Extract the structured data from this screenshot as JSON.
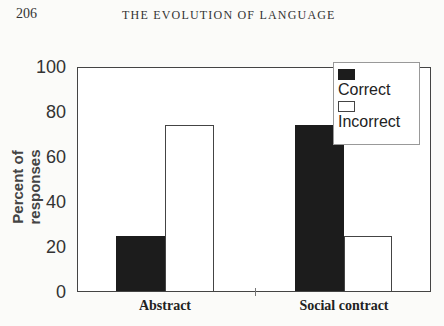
{
  "page": {
    "number": "206",
    "running_head": "THE EVOLUTION OF LANGUAGE"
  },
  "chart": {
    "ylabel": "Percent of responses",
    "yticks": [
      "100",
      "80",
      "60",
      "40",
      "20",
      "0"
    ],
    "categories": [
      "Abstract",
      "Social contract"
    ],
    "legend": {
      "correct": "Correct",
      "incorrect": "Incorrect"
    }
  },
  "chart_data": {
    "type": "bar",
    "title": "",
    "xlabel": "",
    "ylabel": "Percent of responses",
    "ylim": [
      0,
      100
    ],
    "yticks": [
      0,
      20,
      40,
      60,
      80,
      100
    ],
    "categories": [
      "Abstract",
      "Social contract"
    ],
    "series": [
      {
        "name": "Correct",
        "color": "#1c1c1c",
        "values": [
          25,
          75
        ]
      },
      {
        "name": "Incorrect",
        "color": "#ffffff",
        "values": [
          75,
          25
        ]
      }
    ],
    "grid": false,
    "legend_position": "upper right (inside plot)"
  }
}
